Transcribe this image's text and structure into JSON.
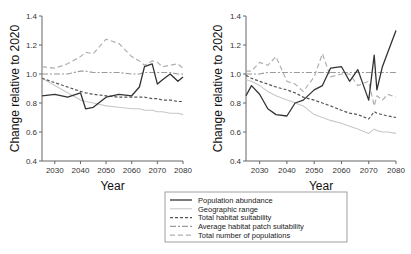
{
  "chart_data": [
    {
      "type": "line",
      "panel": "left",
      "title": "",
      "xlabel": "Year",
      "ylabel": "Change relative to 2020",
      "xlim": [
        2025,
        2080
      ],
      "ylim": [
        0.4,
        1.4
      ],
      "xticks": [
        "2030",
        "2040",
        "2050",
        "2060",
        "2070",
        "2080"
      ],
      "yticks": [
        "0.4",
        "0.6",
        "0.8",
        "1.0",
        "1.2",
        "1.4"
      ],
      "grid": false,
      "x": [
        2025,
        2030,
        2035,
        2040,
        2042,
        2045,
        2050,
        2055,
        2060,
        2063,
        2065,
        2068,
        2070,
        2072,
        2075,
        2078,
        2080
      ],
      "series": [
        {
          "name": "Population abundance",
          "values": [
            0.85,
            0.86,
            0.84,
            0.87,
            0.76,
            0.77,
            0.84,
            0.86,
            0.85,
            0.91,
            1.05,
            1.07,
            0.93,
            0.96,
            1.0,
            0.95,
            0.98
          ]
        },
        {
          "name": "Geographic range",
          "values": [
            0.97,
            0.92,
            0.87,
            0.82,
            0.81,
            0.8,
            0.78,
            0.77,
            0.76,
            0.76,
            0.75,
            0.75,
            0.74,
            0.74,
            0.73,
            0.73,
            0.72
          ]
        },
        {
          "name": "Total habitat suitability",
          "values": [
            0.97,
            0.94,
            0.91,
            0.88,
            0.87,
            0.86,
            0.85,
            0.84,
            0.84,
            0.84,
            0.84,
            0.83,
            0.83,
            0.82,
            0.82,
            0.81,
            0.81
          ]
        },
        {
          "name": "Average habitat patch suitability",
          "values": [
            1.0,
            1.0,
            1.0,
            1.02,
            1.02,
            1.01,
            1.01,
            1.01,
            1.0,
            1.0,
            1.01,
            1.01,
            1.01,
            1.01,
            1.01,
            1.0,
            1.0
          ]
        },
        {
          "name": "Total number of populations",
          "values": [
            1.05,
            1.04,
            1.07,
            1.12,
            1.15,
            1.14,
            1.24,
            1.21,
            1.12,
            1.09,
            1.06,
            1.09,
            1.08,
            1.05,
            1.06,
            1.07,
            1.04
          ]
        }
      ]
    },
    {
      "type": "line",
      "panel": "right",
      "title": "",
      "xlabel": "Year",
      "ylabel": "Change relative to 2020",
      "xlim": [
        2025,
        2080
      ],
      "ylim": [
        0.4,
        1.4
      ],
      "xticks": [
        "2030",
        "2040",
        "2050",
        "2060",
        "2070",
        "2080"
      ],
      "yticks": [
        "0.4",
        "0.6",
        "0.8",
        "1.0",
        "1.2",
        "1.4"
      ],
      "grid": false,
      "x": [
        2025,
        2027,
        2030,
        2033,
        2036,
        2040,
        2043,
        2046,
        2050,
        2053,
        2056,
        2060,
        2063,
        2066,
        2070,
        2072,
        2073,
        2075,
        2077,
        2080
      ],
      "series": [
        {
          "name": "Population abundance",
          "values": [
            0.85,
            0.92,
            0.86,
            0.76,
            0.72,
            0.71,
            0.8,
            0.82,
            0.89,
            0.92,
            1.04,
            1.05,
            0.95,
            1.03,
            0.82,
            1.13,
            0.89,
            1.05,
            1.15,
            1.3
          ]
        },
        {
          "name": "Geographic range",
          "values": [
            0.96,
            0.95,
            0.92,
            0.88,
            0.85,
            0.82,
            0.8,
            0.78,
            0.72,
            0.7,
            0.68,
            0.66,
            0.64,
            0.62,
            0.59,
            0.62,
            0.61,
            0.6,
            0.6,
            0.59
          ]
        },
        {
          "name": "Total habitat suitability",
          "values": [
            0.99,
            0.97,
            0.95,
            0.93,
            0.91,
            0.89,
            0.87,
            0.84,
            0.82,
            0.8,
            0.78,
            0.75,
            0.73,
            0.72,
            0.69,
            0.74,
            0.73,
            0.72,
            0.71,
            0.7
          ]
        },
        {
          "name": "Average habitat patch suitability",
          "values": [
            1.0,
            1.0,
            1.0,
            1.01,
            1.01,
            1.01,
            1.01,
            1.01,
            1.01,
            1.01,
            1.01,
            1.01,
            1.01,
            1.01,
            1.01,
            1.01,
            1.01,
            1.01,
            1.01,
            1.01
          ]
        },
        {
          "name": "Total number of populations",
          "values": [
            1.02,
            1.02,
            1.08,
            1.06,
            1.12,
            0.95,
            0.93,
            0.88,
            0.98,
            1.14,
            0.98,
            1.0,
            1.0,
            0.92,
            0.95,
            0.78,
            0.85,
            0.82,
            0.86,
            0.84
          ]
        }
      ]
    }
  ],
  "legend": {
    "items": [
      {
        "label": "Population abundance",
        "style": "solid",
        "color": "#333333"
      },
      {
        "label": "Geographic range",
        "style": "solid-light",
        "color": "#c8c8c8"
      },
      {
        "label": "Total habitat suitability",
        "style": "dashed",
        "color": "#555555"
      },
      {
        "label": "Average habitat patch suitability",
        "style": "dash-dot",
        "color": "#9a9a9a"
      },
      {
        "label": "Total number of populations",
        "style": "long-dash",
        "color": "#b0b0b0"
      }
    ]
  },
  "labels": {
    "ylabel": "Change relative to 2020",
    "xlabel": "Year"
  }
}
